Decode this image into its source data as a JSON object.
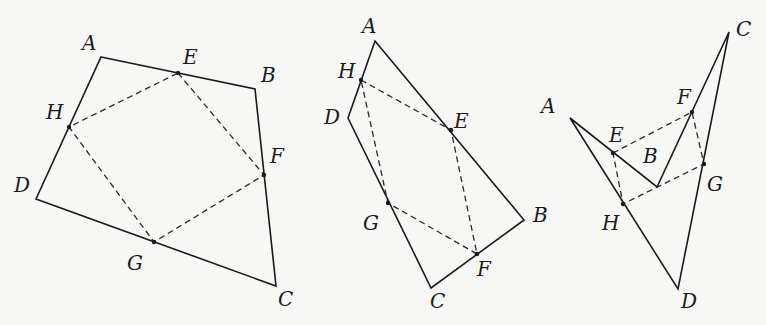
{
  "figures": [
    {
      "id": "fig1",
      "labels": {
        "A": {
          "text": "A",
          "x": 82,
          "y": 50
        },
        "E": {
          "text": "E",
          "x": 183,
          "y": 64
        },
        "B": {
          "text": "B",
          "x": 261,
          "y": 82
        },
        "H": {
          "text": "H",
          "x": 46,
          "y": 119
        },
        "F": {
          "text": "F",
          "x": 270,
          "y": 163
        },
        "D": {
          "text": "D",
          "x": 14,
          "y": 192
        },
        "G": {
          "text": "G",
          "x": 127,
          "y": 270
        },
        "C": {
          "text": "C",
          "x": 278,
          "y": 306
        }
      },
      "quad": "101,57 255,89 276,286 36,199",
      "inner": "178,73 264,175 154,242 69,127"
    },
    {
      "id": "fig2",
      "labels": {
        "A": {
          "text": "A",
          "x": 362,
          "y": 33
        },
        "H": {
          "text": "H",
          "x": 338,
          "y": 78
        },
        "D": {
          "text": "D",
          "x": 324,
          "y": 124
        },
        "E": {
          "text": "E",
          "x": 454,
          "y": 128
        },
        "G": {
          "text": "G",
          "x": 363,
          "y": 230
        },
        "B": {
          "text": "B",
          "x": 533,
          "y": 222
        },
        "F": {
          "text": "F",
          "x": 477,
          "y": 276
        },
        "C": {
          "text": "C",
          "x": 430,
          "y": 308
        }
      },
      "quad": "375,41 524,220 431,288 348,118",
      "inner": "361,80 451,130 477,254 388,203"
    },
    {
      "id": "fig3",
      "labels": {
        "A": {
          "text": "A",
          "x": 541,
          "y": 113
        },
        "E": {
          "text": "E",
          "x": 609,
          "y": 142
        },
        "B": {
          "text": "B",
          "x": 643,
          "y": 163
        },
        "F": {
          "text": "F",
          "x": 677,
          "y": 104
        },
        "C": {
          "text": "C",
          "x": 736,
          "y": 36
        },
        "G": {
          "text": "G",
          "x": 707,
          "y": 191
        },
        "H": {
          "text": "H",
          "x": 602,
          "y": 230
        },
        "D": {
          "text": "D",
          "x": 681,
          "y": 308
        }
      },
      "quad": "570,118 657,187 729,32 678,289",
      "inner": "613,153 692,112 704,164 623,204"
    }
  ],
  "points": {
    "fig1": [
      [
        178,
        73
      ],
      [
        264,
        175
      ],
      [
        154,
        242
      ],
      [
        69,
        127
      ]
    ],
    "fig2": [
      [
        361,
        80
      ],
      [
        451,
        130
      ],
      [
        477,
        254
      ],
      [
        388,
        203
      ]
    ],
    "fig3": [
      [
        613,
        153
      ],
      [
        692,
        112
      ],
      [
        704,
        164
      ],
      [
        623,
        204
      ]
    ]
  }
}
